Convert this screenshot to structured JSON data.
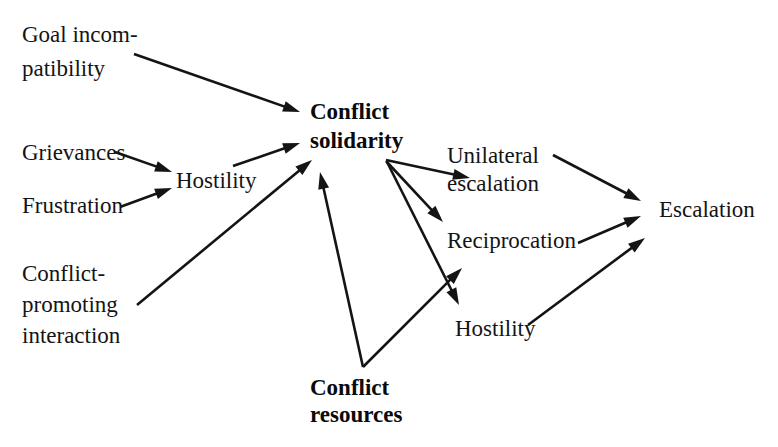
{
  "diagram": {
    "style": {
      "background": "#ffffff",
      "text_color": "#141414",
      "edge_color": "#141414"
    },
    "nodes": [
      {
        "id": "goal-incompatibility",
        "label": "Goal incompatibility",
        "lines": [
          "Goal incom-",
          "patibility"
        ],
        "bold": false,
        "x": 22,
        "y": 42,
        "line_height": 34
      },
      {
        "id": "grievances",
        "label": "Grievances",
        "lines": [
          "Grievances"
        ],
        "bold": false,
        "x": 22,
        "y": 160,
        "line_height": 34
      },
      {
        "id": "frustration",
        "label": "Frustration",
        "lines": [
          "Frustration"
        ],
        "bold": false,
        "x": 22,
        "y": 213,
        "line_height": 34
      },
      {
        "id": "hostility-left",
        "label": "Hostility",
        "lines": [
          "Hostility"
        ],
        "bold": false,
        "x": 176,
        "y": 188,
        "line_height": 34
      },
      {
        "id": "conflict-promoting-interaction",
        "label": "Conflict-promoting interaction",
        "lines": [
          "Conflict-",
          "promoting",
          "interaction"
        ],
        "bold": false,
        "x": 22,
        "y": 281,
        "line_height": 31
      },
      {
        "id": "conflict-solidarity",
        "label": "Conflict solidarity",
        "lines": [
          "Conflict",
          "solidarity"
        ],
        "bold": true,
        "x": 310,
        "y": 119,
        "line_height": 29
      },
      {
        "id": "unilateral-escalation",
        "label": "Unilateral escalation",
        "lines": [
          "Unilateral",
          "escalation"
        ],
        "bold": false,
        "x": 447,
        "y": 163,
        "line_height": 28
      },
      {
        "id": "reciprocation",
        "label": "Reciprocation",
        "lines": [
          "Reciprocation"
        ],
        "bold": false,
        "x": 447,
        "y": 248,
        "line_height": 28
      },
      {
        "id": "hostility-right",
        "label": "Hostility",
        "lines": [
          "Hostility"
        ],
        "bold": false,
        "x": 455,
        "y": 336,
        "line_height": 28
      },
      {
        "id": "escalation",
        "label": "Escalation",
        "lines": [
          "Escalation"
        ],
        "bold": false,
        "x": 659,
        "y": 217,
        "line_height": 28
      },
      {
        "id": "conflict-resources",
        "label": "Conflict resources",
        "lines": [
          "Conflict",
          "resources"
        ],
        "bold": true,
        "x": 310,
        "y": 395,
        "line_height": 27
      }
    ],
    "edges": [
      {
        "id": "goal-incompatibility-to-conflict-solidarity",
        "from": "goal-incompatibility",
        "to": "conflict-solidarity",
        "x1": 134,
        "y1": 54,
        "x2": 300,
        "y2": 112
      },
      {
        "id": "grievances-to-hostility",
        "from": "grievances",
        "to": "hostility-left",
        "x1": 115,
        "y1": 152,
        "x2": 172,
        "y2": 172
      },
      {
        "id": "frustration-to-hostility",
        "from": "frustration",
        "to": "hostility-left",
        "x1": 120,
        "y1": 207,
        "x2": 172,
        "y2": 188
      },
      {
        "id": "hostility-to-conflict-solidarity",
        "from": "hostility-left",
        "to": "conflict-solidarity",
        "x1": 233,
        "y1": 166,
        "x2": 300,
        "y2": 143
      },
      {
        "id": "conflict-promoting-interaction-to-conflict-solidarity",
        "from": "conflict-promoting-interaction",
        "to": "conflict-solidarity",
        "x1": 137,
        "y1": 305,
        "x2": 312,
        "y2": 160
      },
      {
        "id": "conflict-solidarity-to-unilateral-escalation",
        "from": "conflict-solidarity",
        "to": "unilateral-escalation",
        "x1": 386,
        "y1": 160,
        "x2": 470,
        "y2": 178
      },
      {
        "id": "conflict-solidarity-to-reciprocation",
        "from": "conflict-solidarity",
        "to": "reciprocation",
        "x1": 386,
        "y1": 161,
        "x2": 443,
        "y2": 222
      },
      {
        "id": "conflict-solidarity-to-hostility-right",
        "from": "conflict-solidarity",
        "to": "hostility-right",
        "x1": 387,
        "y1": 162,
        "x2": 459,
        "y2": 305
      },
      {
        "id": "conflict-resources-to-conflict-solidarity",
        "from": "conflict-resources",
        "to": "conflict-solidarity",
        "x1": 363,
        "y1": 367,
        "x2": 320,
        "y2": 172
      },
      {
        "id": "conflict-resources-to-reciprocation",
        "from": "conflict-resources",
        "to": "reciprocation",
        "x1": 363,
        "y1": 367,
        "x2": 462,
        "y2": 268
      },
      {
        "id": "unilateral-escalation-to-escalation",
        "from": "unilateral-escalation",
        "to": "escalation",
        "x1": 553,
        "y1": 155,
        "x2": 641,
        "y2": 201
      },
      {
        "id": "reciprocation-to-escalation",
        "from": "reciprocation",
        "to": "escalation",
        "x1": 578,
        "y1": 243,
        "x2": 641,
        "y2": 216
      },
      {
        "id": "hostility-right-to-escalation",
        "from": "hostility-right",
        "to": "escalation",
        "x1": 528,
        "y1": 325,
        "x2": 645,
        "y2": 238
      }
    ]
  }
}
